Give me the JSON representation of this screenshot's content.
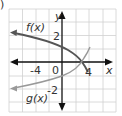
{
  "problem_marker": ")",
  "axes": {
    "x_label": "x",
    "y_label": "y",
    "x_ticks": [
      "-4",
      "0",
      "4"
    ],
    "y_ticks": [
      "2",
      "-2"
    ]
  },
  "curves": [
    {
      "name": "f(x)",
      "label": "f(x)",
      "color": "#555555"
    },
    {
      "name": "g(x)",
      "label": "g(x)",
      "color": "#999999"
    }
  ],
  "colors": {
    "grid": "#d0d0d0",
    "axis": "#111111"
  }
}
